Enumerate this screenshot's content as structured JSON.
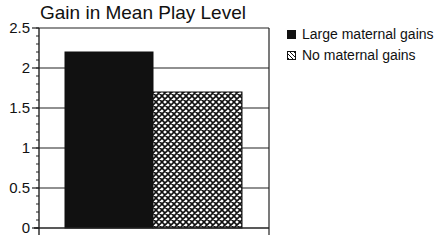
{
  "chart_data": {
    "type": "bar",
    "title": "Gain in Mean Play Level",
    "xlabel": "",
    "ylabel": "",
    "categories": [
      ""
    ],
    "series": [
      {
        "name": "Large maternal gains",
        "values": [
          2.2
        ],
        "fill": "solid",
        "color": "#111111"
      },
      {
        "name": "No maternal gains",
        "values": [
          1.7
        ],
        "fill": "crosshatch",
        "color": "#111111"
      }
    ],
    "ylim": [
      0,
      2.5
    ],
    "yticks": [
      0,
      0.5,
      1,
      1.5,
      2,
      2.5
    ],
    "ytick_labels": [
      "0",
      "0.5",
      "1",
      "1.5",
      "2",
      "2.5"
    ],
    "minor_tick_step": 0.1,
    "grid": true,
    "legend_position": "right"
  },
  "legend": {
    "items": [
      {
        "label": "Large maternal gains",
        "icon": "solid-square-icon"
      },
      {
        "label": "No maternal gains",
        "icon": "crosshatch-square-icon"
      }
    ]
  }
}
